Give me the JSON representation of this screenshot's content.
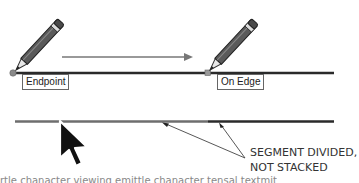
{
  "diagram": {
    "labels": {
      "endpoint": "Endpoint",
      "on_edge": "On Edge"
    },
    "callout": {
      "line1": "SEGMENT DIVIDED,",
      "line2": "NOT STACKED"
    },
    "cut_off_text": "rtle chanacter viewing emittle chanacter tensal textmit"
  },
  "colors": {
    "line_dark": "#2a2a2a",
    "line_gray": "#6e6e6e",
    "arrow": "#777777",
    "endpoint_marker": "#8a8a8a",
    "pencil_body": "#5a5a5a"
  }
}
